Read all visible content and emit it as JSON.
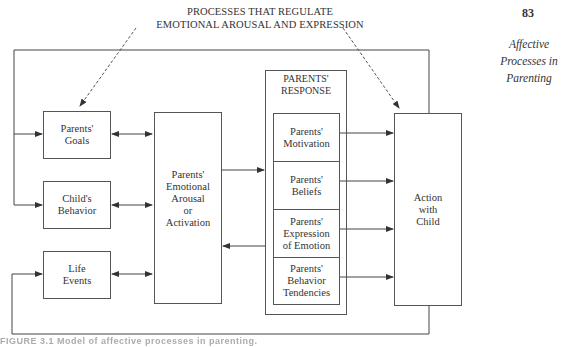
{
  "page": {
    "number": "83",
    "running_head": [
      "Affective",
      "Processes in",
      "Parenting"
    ]
  },
  "figure": {
    "regulation_label": [
      "PROCESSES THAT REGULATE",
      "EMOTIONAL AROUSAL AND EXPRESSION"
    ],
    "inputs": [
      {
        "label": [
          "Parents'",
          "Goals"
        ]
      },
      {
        "label": [
          "Child's",
          "Behavior"
        ]
      },
      {
        "label": [
          "Life",
          "Events"
        ]
      }
    ],
    "emotional_arousal": {
      "label": [
        "Parents'",
        "Emotional",
        "Arousal",
        "or",
        "Activation"
      ]
    },
    "response": {
      "title": [
        "PARENTS'",
        "RESPONSE"
      ],
      "components": [
        {
          "label": [
            "Parents'",
            "Motivation"
          ]
        },
        {
          "label": [
            "Parents'",
            "Beliefs"
          ]
        },
        {
          "label": [
            "Parents'",
            "Expression",
            "of Emotion"
          ]
        },
        {
          "label": [
            "Parents'",
            "Behavior",
            "Tendencies"
          ]
        }
      ]
    },
    "action": {
      "label": [
        "Action",
        "with",
        "Child"
      ]
    },
    "caption_fragment": "FIGURE 3.1  Model of affective processes in parenting."
  },
  "colors": {
    "line": "#444444",
    "dashed": "#555555",
    "text": "#333333",
    "background": "#ffffff"
  }
}
